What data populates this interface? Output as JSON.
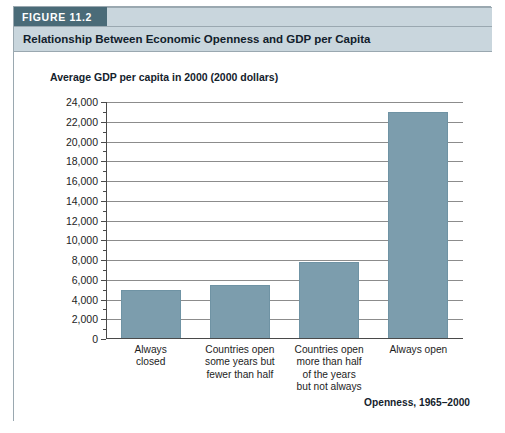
{
  "figure": {
    "badge": "FIGURE 11.2",
    "title": "Relationship Between Economic Openness and GDP per Capita"
  },
  "colors": {
    "badge_bg": "#4a6b78",
    "title_band_bg": "#c9d6dd",
    "bar_fill": "#7c9dad",
    "gridline": "#8c8c8c",
    "axis": "#4a4a4a",
    "card_border": "#9aa8b0"
  },
  "chart_data": {
    "type": "bar",
    "title": "Relationship Between Economic Openness and GDP per Capita",
    "ylabel": "Average GDP per capita in 2000 (2000 dollars)",
    "xlabel": "Openness, 1965–2000",
    "categories": [
      "Always closed",
      "Countries open some years but fewer than half",
      "Countries open more than half of the years but not always",
      "Always open"
    ],
    "category_lines": [
      [
        "Always",
        "closed"
      ],
      [
        "Countries open",
        "some years but",
        "fewer than half"
      ],
      [
        "Countries open",
        "more than half",
        "of the years",
        "but not always"
      ],
      [
        "Always open"
      ]
    ],
    "values": [
      5000,
      5500,
      7800,
      23000
    ],
    "ylim": [
      0,
      24000
    ],
    "ytick_step": 2000,
    "yminor_step": 1000,
    "ytick_labels": [
      "0",
      "2,000",
      "4,000",
      "6,000",
      "8,000",
      "10,000",
      "12,000",
      "14,000",
      "16,000",
      "18,000",
      "20,000",
      "22,000",
      "24,000"
    ],
    "grid": true,
    "legend": "none"
  }
}
